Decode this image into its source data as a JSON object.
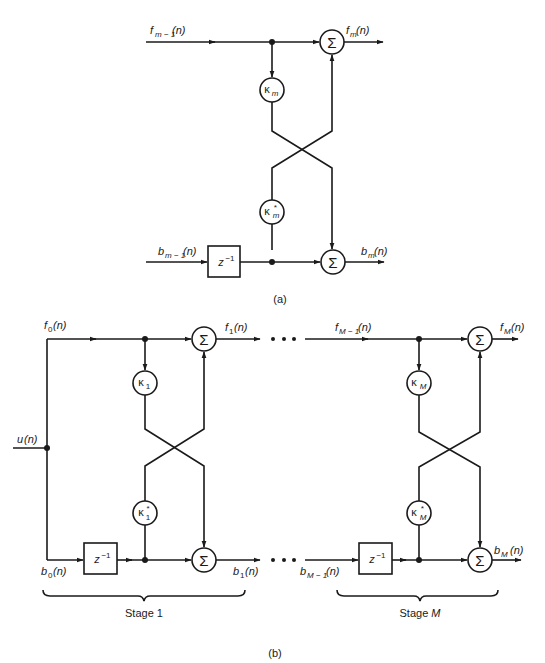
{
  "figure": {
    "colors": {
      "ink": "#1a1a1a",
      "background": "#ffffff"
    }
  },
  "part_a": {
    "caption": "(a)",
    "inputs": {
      "forward": {
        "base": "f",
        "sub": "m − 1",
        "arg": "(n)"
      },
      "backward": {
        "base": "b",
        "sub": "m − 1",
        "arg": "(n)"
      }
    },
    "outputs": {
      "forward": {
        "base": "f",
        "sub": "m",
        "arg": "(n)"
      },
      "backward": {
        "base": "b",
        "sub": "m",
        "arg": "(n)"
      }
    },
    "coefficients": {
      "upper": {
        "base": "κ",
        "sub": "m",
        "sup": ""
      },
      "lower": {
        "base": "κ",
        "sub": "m",
        "sup": "*"
      }
    },
    "summer_symbol": "Σ",
    "delay": {
      "base": "z",
      "sup": "−1"
    }
  },
  "part_b": {
    "caption": "(b)",
    "input": {
      "base": "u",
      "arg": "(n)"
    },
    "labels": {
      "f0": {
        "base": "f",
        "sub": "0",
        "arg": "(n)"
      },
      "b0": {
        "base": "b",
        "sub": "0",
        "arg": "(n)"
      },
      "f1": {
        "base": "f",
        "sub": "1",
        "arg": "(n)"
      },
      "b1": {
        "base": "b",
        "sub": "1",
        "arg": "(n)"
      },
      "fM1": {
        "base": "f",
        "sub": "M − 1",
        "arg": "(n)"
      },
      "bM1": {
        "base": "b",
        "sub": "M − 1",
        "arg": "(n)"
      },
      "fM": {
        "base": "f",
        "sub": "M",
        "arg": "(n)"
      },
      "bM": {
        "base": "b",
        "sub": "M",
        "arg": "(n)"
      }
    },
    "stages": [
      {
        "name": "Stage 1",
        "label_prefix": "Stage ",
        "label_index": "1",
        "upper_coef": {
          "base": "κ",
          "sub": "1",
          "sup": ""
        },
        "lower_coef": {
          "base": "κ",
          "sub": "1",
          "sup": "*"
        }
      },
      {
        "name": "Stage M",
        "label_prefix": "Stage ",
        "label_index": "M",
        "upper_coef": {
          "base": "κ",
          "sub": "M",
          "sup": ""
        },
        "lower_coef": {
          "base": "κ",
          "sub": "M",
          "sup": "*"
        }
      }
    ],
    "ellipsis": "• • •",
    "summer_symbol": "Σ",
    "delay": {
      "base": "z",
      "sup": "−1"
    }
  }
}
